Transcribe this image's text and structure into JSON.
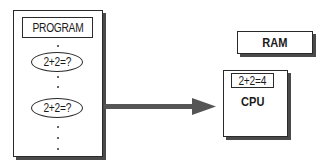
{
  "program_box": {
    "title": "PROGRAM",
    "instructions": [
      "2+2=?",
      "2+2=?"
    ],
    "continuation": "..."
  },
  "arrow": {
    "direction": "right",
    "color": "#555555"
  },
  "ram_box": {
    "label": "RAM"
  },
  "cpu_box": {
    "label": "CPU",
    "register_value": "2+2=4"
  }
}
